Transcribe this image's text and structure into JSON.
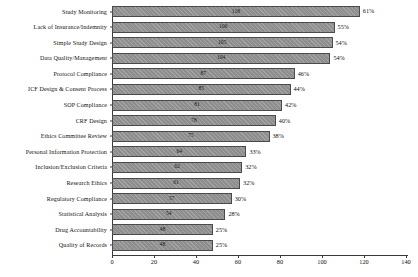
{
  "chart_data": {
    "type": "bar",
    "orientation": "horizontal",
    "title": "",
    "xlabel": "",
    "ylabel": "",
    "xlim": [
      0,
      140
    ],
    "grid": false,
    "legend": null,
    "xticks": [
      0,
      20,
      40,
      60,
      80,
      100,
      120,
      140
    ],
    "categories": [
      "Study Monitoring",
      "Lack of Insurance/Indemnity",
      "Simple Study Design",
      "Data Quality/Management",
      "Protocol Compliance",
      "ICF Design & Consent Process",
      "SOP Compliance",
      "CRF Design",
      "Ethics Committee Review",
      "Personal Information Protection",
      "Inclusion/Exclusion Criteria",
      "Research Ethics",
      "Regulatory Compliance",
      "Statistical Analysis",
      "Drug Accountability",
      "Quality of Records"
    ],
    "values": [
      118,
      106,
      105,
      104,
      87,
      85,
      81,
      78,
      75,
      64,
      62,
      61,
      57,
      54,
      48,
      48
    ],
    "percent_labels": [
      "61%",
      "55%",
      "54%",
      "54%",
      "46%",
      "44%",
      "42%",
      "40%",
      "38%",
      "33%",
      "32%",
      "32%",
      "30%",
      "28%",
      "25%",
      "25%"
    ],
    "bar_color": "#8e8e8e",
    "bar_edge_color": "#4a4a4a",
    "axis_color": "#3a3a3a"
  },
  "caption": ""
}
